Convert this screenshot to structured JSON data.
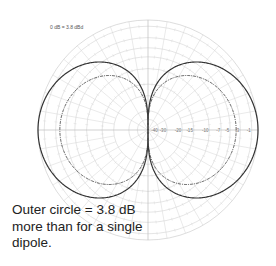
{
  "chart_data": {
    "type": "polar",
    "title": "",
    "reference_label": "0 dB = 3.8 dBd",
    "scale": "ARRL log-periodic",
    "radial_ticks_db": [
      -1,
      -3,
      -5,
      -7,
      -10,
      -15,
      -20,
      -30,
      -40
    ],
    "radial_tick_labels": [
      "-40",
      "-30",
      "-20",
      "-15",
      "-10",
      "-7",
      "-5",
      "-3",
      "-1"
    ],
    "angular_grid_step_deg": 10,
    "series": [
      {
        "name": "Array (outer pattern)",
        "style": "solid",
        "color": "#333333",
        "peak_db": 0,
        "pattern": "figure-8, |cos(phi)|, maxima at 0 deg and 180 deg, nulls at 90 deg and 270 deg"
      },
      {
        "name": "Single dipole",
        "style": "dash-dot",
        "color": "#444444",
        "peak_db": -3.8,
        "pattern": "figure-8, |cos(phi)|, maxima at 0 deg and 180 deg, nulls at 90 deg and 270 deg"
      }
    ],
    "annotation": "Outer circle = 3.8 dB more than for a single dipole."
  },
  "header": {
    "reference_label": "0 dB = 3.8 dBd"
  },
  "caption": {
    "lines": [
      "Outer circle = 3.8 dB",
      "more than for a single",
      "dipole."
    ]
  },
  "colors": {
    "grid": "#d4d4d4",
    "axis": "#bdbdbd",
    "outer_pattern": "#333333",
    "inner_pattern": "#444444"
  }
}
